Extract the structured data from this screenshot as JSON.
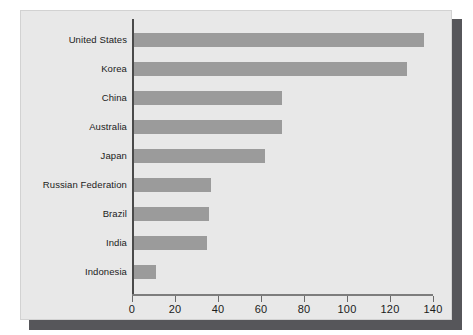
{
  "chart_data": {
    "type": "bar",
    "orientation": "horizontal",
    "title": "",
    "subtitle": "",
    "xlabel": "",
    "ylabel": "",
    "categories": [
      "United States",
      "Korea",
      "China",
      "Australia",
      "Japan",
      "Russian Federation",
      "Brazil",
      "India",
      "Indonesia"
    ],
    "values": [
      135,
      127,
      69,
      69,
      61,
      36,
      35,
      34,
      10
    ],
    "xlim": [
      0,
      140
    ],
    "xticks": [
      0,
      20,
      40,
      60,
      80,
      100,
      120,
      140
    ],
    "xtick_labels": [
      "0",
      "20",
      "40",
      "60",
      "80",
      "100",
      "120",
      "140"
    ],
    "grid": false,
    "legend": null,
    "series": [
      {
        "name": "",
        "values": [
          135,
          127,
          69,
          69,
          61,
          36,
          35,
          34,
          10
        ]
      }
    ]
  },
  "style": {
    "bar_color": "#9b9b9b",
    "panel_background": "#e8e8e8",
    "page_background": "#ffffff",
    "axis_color": "#4a4a4a",
    "tick_color": "#6a6a6a",
    "text_color": "#1b1b1b",
    "shadow_color": "#56565a"
  }
}
